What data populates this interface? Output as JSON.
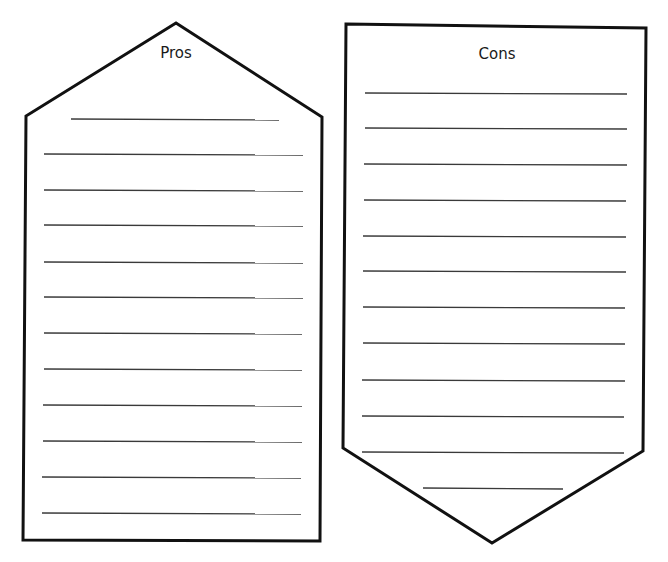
{
  "page": {
    "background": "#ffffff",
    "stroke_color": "#111111",
    "line_color": "#3a3a3a"
  },
  "pros": {
    "title": "Pros",
    "shape": "house-pentagon-point-up",
    "polygon": [
      [
        176,
        23
      ],
      [
        322,
        117
      ],
      [
        320,
        541
      ],
      [
        23,
        540
      ],
      [
        26,
        116
      ]
    ],
    "title_pos": [
      176,
      44
    ],
    "lines": [
      {
        "x1": 71,
        "x2": 279,
        "y": 119
      },
      {
        "x1": 44,
        "x2": 303,
        "y": 154
      },
      {
        "x1": 44,
        "x2": 303,
        "y": 190
      },
      {
        "x1": 44,
        "x2": 303,
        "y": 225
      },
      {
        "x1": 44,
        "x2": 303,
        "y": 262
      },
      {
        "x1": 44,
        "x2": 303,
        "y": 297
      },
      {
        "x1": 44,
        "x2": 302,
        "y": 333
      },
      {
        "x1": 44,
        "x2": 302,
        "y": 369
      },
      {
        "x1": 43,
        "x2": 302,
        "y": 405
      },
      {
        "x1": 43,
        "x2": 302,
        "y": 441
      },
      {
        "x1": 42,
        "x2": 301,
        "y": 477
      },
      {
        "x1": 42,
        "x2": 301,
        "y": 513
      }
    ]
  },
  "cons": {
    "title": "Cons",
    "shape": "pennant-pentagon-point-down",
    "polygon": [
      [
        346,
        24
      ],
      [
        646,
        28
      ],
      [
        643,
        451
      ],
      [
        492,
        543
      ],
      [
        343,
        448
      ]
    ],
    "title_pos": [
      497,
      45
    ],
    "lines": [
      {
        "x1": 365,
        "x2": 627,
        "y": 93
      },
      {
        "x1": 365,
        "x2": 627,
        "y": 128
      },
      {
        "x1": 364,
        "x2": 627,
        "y": 164
      },
      {
        "x1": 364,
        "x2": 626,
        "y": 200
      },
      {
        "x1": 363,
        "x2": 626,
        "y": 236
      },
      {
        "x1": 363,
        "x2": 626,
        "y": 271
      },
      {
        "x1": 363,
        "x2": 625,
        "y": 307
      },
      {
        "x1": 363,
        "x2": 625,
        "y": 343
      },
      {
        "x1": 362,
        "x2": 625,
        "y": 380
      },
      {
        "x1": 362,
        "x2": 624,
        "y": 416
      },
      {
        "x1": 362,
        "x2": 624,
        "y": 452
      },
      {
        "x1": 423,
        "x2": 563,
        "y": 488
      }
    ]
  }
}
